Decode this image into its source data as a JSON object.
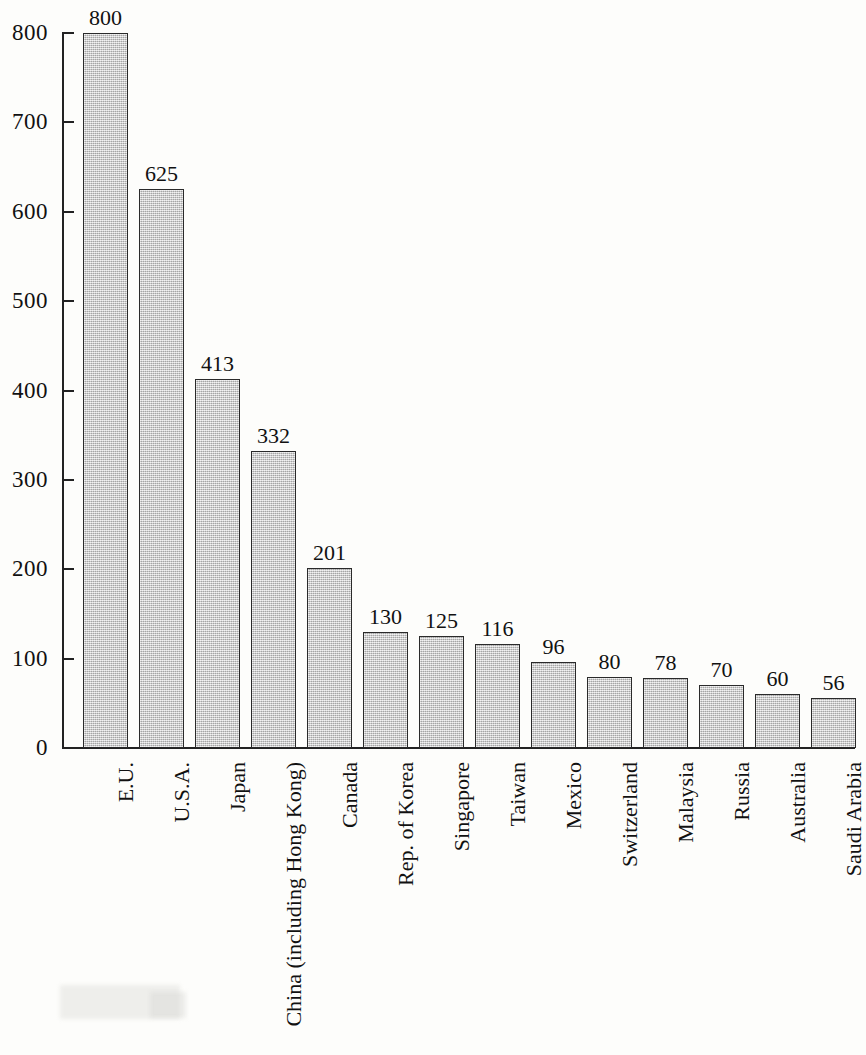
{
  "chart_data": {
    "type": "bar",
    "title": "",
    "subtitle": "",
    "xlabel": "",
    "ylabel": "",
    "ylim": [
      0,
      800
    ],
    "y_tick_step": 100,
    "grid": false,
    "legend": null,
    "orientation": "vertical",
    "bar_fill_color": "#cacaca",
    "bar_border_color": "#2a2a2a",
    "background_color": "#fdfdfb",
    "text_color": "#111111",
    "value_labels_shown": true,
    "category_label_rotation": -90,
    "yticks": [
      "0",
      "100",
      "200",
      "300",
      "400",
      "500",
      "600",
      "700",
      "800"
    ],
    "ytick_values": [
      0,
      100,
      200,
      300,
      400,
      500,
      600,
      700,
      800
    ],
    "categories": [
      "E.U.",
      "U.S.A.",
      "Japan",
      "China (including Hong Kong)",
      "Canada",
      "Rep. of Korea",
      "Singapore",
      "Taiwan",
      "Mexico",
      "Switzerland",
      "Malaysia",
      "Russia",
      "Australia",
      "Saudi Arabia"
    ],
    "values": [
      800,
      625,
      413,
      332,
      201,
      130,
      125,
      116,
      96,
      80,
      78,
      70,
      60,
      56
    ],
    "value_labels": [
      "800",
      "625",
      "413",
      "332",
      "201",
      "130",
      "125",
      "116",
      "96",
      "80",
      "78",
      "70",
      "60",
      "56"
    ]
  }
}
